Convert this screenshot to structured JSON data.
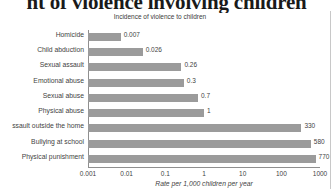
{
  "page": {
    "heading": "nt of violence involving children"
  },
  "chart_data": {
    "type": "bar",
    "orientation": "horizontal",
    "title": "Incidence of violence to children",
    "xlabel": "Rate per 1,000 children per year",
    "ylabel": "",
    "xscale": "log",
    "xlim": [
      0.001,
      1000
    ],
    "xticks": [
      "0.001",
      "0.01",
      "0.1",
      "1",
      "10",
      "100",
      "1000"
    ],
    "xtick_values": [
      0.001,
      0.01,
      0.1,
      1,
      10,
      100,
      1000
    ],
    "grid": false,
    "legend": false,
    "bar_color": "#9b9b9b",
    "categories": [
      "Homicide",
      "Child abduction",
      "Sexual assault",
      "Emotional abuse",
      "Sexual abuse",
      "Physical abuse",
      "ssault outside the home",
      "Bullying at school",
      "Physical punishment"
    ],
    "values": [
      0.007,
      0.026,
      0.26,
      0.3,
      0.7,
      1,
      330,
      580,
      770
    ],
    "value_labels": [
      "0.007",
      "0.026",
      "0.26",
      "0.3",
      "0.7",
      "1",
      "330",
      "580",
      "770"
    ]
  }
}
